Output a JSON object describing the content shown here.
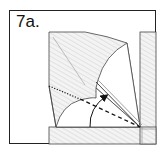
{
  "step": {
    "label": "7a."
  },
  "colors": {
    "frame": "#222222",
    "paper_white": "#ffffff",
    "hatch_bg": "#f2f2f2",
    "hatch_line": "#d0d0d0",
    "crease": "#444444",
    "arrow": "#111111"
  },
  "diagram": {
    "elements": [
      "hatched paper layers (colored side)",
      "white exposed paper regions",
      "dotted crease line (existing fold)",
      "dashed valley fold line",
      "curved arrow showing fold direction",
      "right vertical strip",
      "bottom horizontal strip"
    ]
  }
}
